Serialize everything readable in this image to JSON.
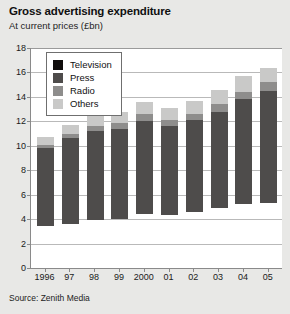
{
  "header": {
    "title": "Gross advertising expenditure",
    "subtitle": "At current prices (£bn)"
  },
  "source": "Source: Zenith Media",
  "legend": {
    "items": [
      {
        "label": "Television",
        "color": "#100d0c",
        "key": "television"
      },
      {
        "label": "Press",
        "color": "#4e4c4b",
        "key": "press"
      },
      {
        "label": "Radio",
        "color": "#8e8d8c",
        "key": "radio"
      },
      {
        "label": "Others",
        "color": "#c9c9c8",
        "key": "others"
      }
    ]
  },
  "chart_data": {
    "type": "bar",
    "stacked": true,
    "title": "Gross advertising expenditure",
    "subtitle": "At current prices (£bn)",
    "xlabel": "",
    "ylabel": "",
    "ylim": [
      0,
      18
    ],
    "yticks": [
      0,
      2,
      4,
      6,
      8,
      10,
      12,
      14,
      16,
      18
    ],
    "ytick_labels": [
      "0",
      "2",
      "4",
      "6",
      "8",
      "10",
      "12",
      "14",
      "16",
      "18"
    ],
    "grid": true,
    "legend_position": "top-left-inside",
    "categories": [
      "1996",
      "97",
      "98",
      "99",
      "2000",
      "01",
      "02",
      "03",
      "04",
      "05"
    ],
    "series": [
      {
        "name": "Television",
        "color": "#100d0c",
        "values": [
          3.4,
          3.6,
          3.9,
          4.0,
          4.4,
          4.3,
          4.6,
          4.9,
          5.2,
          5.3
        ]
      },
      {
        "name": "Press",
        "color": "#4e4c4b",
        "values": [
          6.4,
          7.0,
          7.3,
          7.4,
          7.6,
          7.3,
          7.5,
          7.9,
          8.6,
          9.2
        ]
      },
      {
        "name": "Radio",
        "color": "#8e8d8c",
        "values": [
          0.3,
          0.4,
          0.4,
          0.5,
          0.6,
          0.5,
          0.5,
          0.6,
          0.6,
          0.7
        ]
      },
      {
        "name": "Others",
        "color": "#c9c9c8",
        "values": [
          0.6,
          0.7,
          0.8,
          0.9,
          1.0,
          1.0,
          1.1,
          1.2,
          1.3,
          1.2
        ]
      }
    ],
    "totals": [
      10.7,
      11.7,
      12.4,
      12.8,
      13.6,
      13.1,
      13.7,
      14.6,
      15.7,
      16.4
    ]
  }
}
